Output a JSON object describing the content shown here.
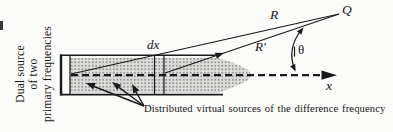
{
  "colors": {
    "ink": "#1a1a1a",
    "beam_base": "#dcdcda",
    "beam_dot": "#979795",
    "background": "#fbfbf9"
  },
  "diagram": {
    "source_label": {
      "lines": [
        "Dual source",
        "of two",
        "primary frequencies"
      ]
    },
    "slab_label": "dx",
    "ray_far_label": "R",
    "ray_near_label": "R'",
    "field_point_label": "Q",
    "angle_label": "θ",
    "axis_label": "x",
    "caption": "Distributed virtual sources of the difference frequency"
  }
}
